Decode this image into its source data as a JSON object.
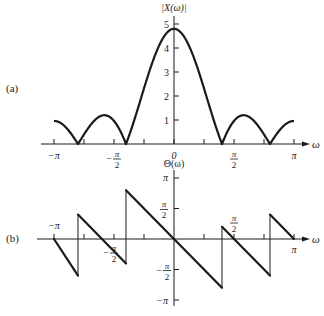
{
  "figure": {
    "panel_a_label": "(a)",
    "panel_b_label": "(b)",
    "colors": {
      "ink": "#1a1a1a",
      "background": "#ffffff"
    }
  },
  "chart_data": [
    {
      "panel": "(a)",
      "type": "line",
      "title": "",
      "ylabel": "|X(ω)|",
      "xlabel": "ω",
      "xlim": [
        -3.1416,
        3.1416
      ],
      "ylim": [
        0,
        5
      ],
      "x_ticks": [
        {
          "value": -3.1416,
          "label": "−π"
        },
        {
          "value": -2.3562,
          "label": ""
        },
        {
          "value": -1.5708,
          "label": "−π/2"
        },
        {
          "value": -0.7854,
          "label": ""
        },
        {
          "value": 0,
          "label": "0"
        },
        {
          "value": 0.7854,
          "label": ""
        },
        {
          "value": 1.5708,
          "label": "π/2"
        },
        {
          "value": 2.3562,
          "label": ""
        },
        {
          "value": 3.1416,
          "label": "π"
        }
      ],
      "y_ticks": [
        {
          "value": 1,
          "label": "1"
        },
        {
          "value": 2,
          "label": "2"
        },
        {
          "value": 3,
          "label": "3"
        },
        {
          "value": 4,
          "label": "4"
        },
        {
          "value": 5,
          "label": "5"
        }
      ],
      "grid": false,
      "description": "Magnitude |sin(5ω/2)/sin(ω/2)| scaled to peak ≈4.8; zeros at ±2π/5 and ±4π/5",
      "x": [
        -3.1416,
        -2.8274,
        -2.5133,
        -2.1991,
        -1.885,
        -1.5708,
        -1.2566,
        -0.9425,
        -0.6283,
        -0.3142,
        0,
        0.3142,
        0.6283,
        0.9425,
        1.2566,
        1.5708,
        1.885,
        2.1991,
        2.5133,
        2.8274,
        3.1416
      ],
      "values": [
        1.0,
        0.62,
        0.0,
        0.86,
        1.24,
        1.0,
        0.0,
        1.26,
        3.3,
        4.6,
        4.8,
        4.6,
        3.3,
        1.26,
        0.0,
        1.0,
        1.24,
        0.86,
        0.0,
        0.62,
        1.0
      ],
      "peak": 4.8
    },
    {
      "panel": "(b)",
      "type": "line",
      "title": "",
      "ylabel": "Θ(ω)",
      "xlabel": "ω",
      "xlim": [
        -3.1416,
        3.1416
      ],
      "ylim": [
        -3.1416,
        3.1416
      ],
      "x_ticks": [
        {
          "value": -3.1416,
          "label": "−π"
        },
        {
          "value": -2.3562,
          "label": ""
        },
        {
          "value": -1.5708,
          "label": "−π/2"
        },
        {
          "value": -0.7854,
          "label": ""
        },
        {
          "value": 0,
          "label": ""
        },
        {
          "value": 0.7854,
          "label": ""
        },
        {
          "value": 1.5708,
          "label": "π/2"
        },
        {
          "value": 2.3562,
          "label": ""
        },
        {
          "value": 3.1416,
          "label": "π"
        }
      ],
      "y_ticks": [
        {
          "value": 3.1416,
          "label": "π"
        },
        {
          "value": 1.5708,
          "label": "π/2"
        },
        {
          "value": -1.5708,
          "label": "−π/2"
        },
        {
          "value": -3.1416,
          "label": "−π"
        }
      ],
      "grid": false,
      "description": "Piecewise-linear phase Θ(ω) = −2ω with jumps of π at zeros ±2π/5, ±4π/5",
      "segments": [
        {
          "x": [
            -3.1416,
            -2.5133
          ],
          "y": [
            0,
            -1.885
          ]
        },
        {
          "x": [
            -2.5133,
            -1.2566
          ],
          "y": [
            1.2566,
            -1.2566
          ]
        },
        {
          "x": [
            -1.2566,
            1.2566
          ],
          "y": [
            2.5133,
            -2.5133
          ]
        },
        {
          "x": [
            1.2566,
            2.5133
          ],
          "y": [
            0.6283,
            -1.885
          ]
        },
        {
          "x": [
            2.5133,
            3.1416
          ],
          "y": [
            1.2566,
            0
          ]
        }
      ],
      "jumps_at": [
        -2.5133,
        -1.2566,
        1.2566,
        2.5133
      ]
    }
  ]
}
